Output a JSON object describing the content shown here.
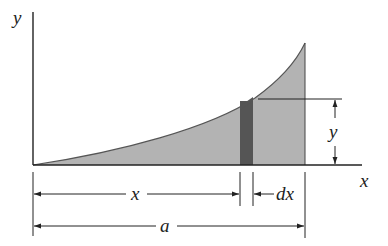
{
  "figure": {
    "labels": {
      "y_axis": "y",
      "x_axis": "x",
      "strip_height": "y",
      "strip_position": "x",
      "strip_width": "dx",
      "total_length": "a"
    },
    "colors": {
      "area_fill": "#b3b3b3",
      "strip_fill": "#555555",
      "line": "#222222",
      "background": "#ffffff"
    }
  }
}
